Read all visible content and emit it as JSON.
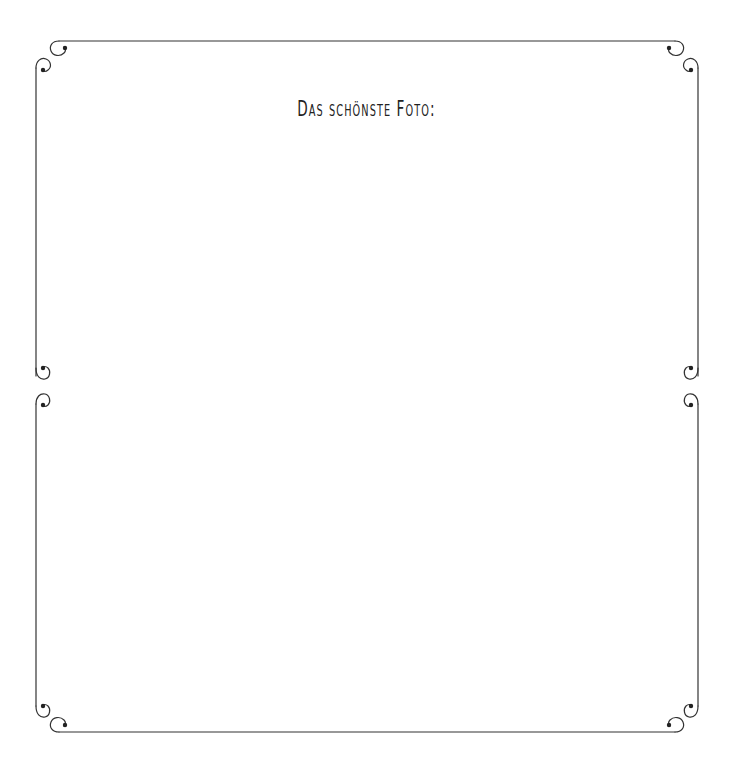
{
  "page": {
    "title": "Das schönste Foto:",
    "colors": {
      "background": "#ffffff",
      "frame_line": "#333333",
      "text": "#222222"
    }
  },
  "panels": [
    {
      "name": "photo-panel-top",
      "description": "empty photo area"
    },
    {
      "name": "photo-panel-bottom",
      "description": "empty photo area"
    }
  ],
  "decorations": {
    "corner_style": "scroll-curl-icon"
  }
}
